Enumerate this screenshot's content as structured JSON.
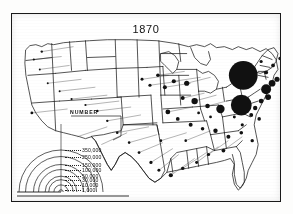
{
  "figure": {
    "year_label": "1870",
    "frame_present": true
  },
  "legend": {
    "title": "NUMBER",
    "entries": [
      {
        "value_label": "350,000",
        "value": 350000
      },
      {
        "value_label": "250,000",
        "value": 250000
      },
      {
        "value_label": "150,000",
        "value": 150000
      },
      {
        "value_label": "100,000",
        "value": 100000
      },
      {
        "value_label": "50,000",
        "value": 50000
      },
      {
        "value_label": "30,000",
        "value": 30000
      },
      {
        "value_label": "10,000",
        "value": 10000
      },
      {
        "value_label": "1,000",
        "value": 1000
      }
    ]
  },
  "colors": {
    "ink": "#1a1a1a",
    "paper": "#ffffff",
    "symbol_fill": "#111111"
  },
  "chart_data": {
    "type": "scatter",
    "title": "1870",
    "xlabel": "",
    "ylabel": "",
    "legend_title": "NUMBER",
    "legend_breaks": [
      350000,
      250000,
      150000,
      100000,
      50000,
      30000,
      10000,
      1000
    ],
    "series": [
      {
        "name": "city-population-symbols",
        "points": [
          {
            "x": 233,
            "y": 62,
            "r": 14.5,
            "value": 350000
          },
          {
            "x": 231,
            "y": 92,
            "r": 10.5,
            "value": 250000
          },
          {
            "x": 256,
            "y": 76,
            "r": 5.0,
            "value": 100000
          },
          {
            "x": 262,
            "y": 70,
            "r": 3.4,
            "value": 60000
          },
          {
            "x": 267,
            "y": 66,
            "r": 2.6,
            "value": 40000
          },
          {
            "x": 258,
            "y": 84,
            "r": 3.0,
            "value": 45000
          },
          {
            "x": 251,
            "y": 88,
            "r": 2.4,
            "value": 32000
          },
          {
            "x": 245,
            "y": 95,
            "r": 2.2,
            "value": 28000
          },
          {
            "x": 241,
            "y": 102,
            "r": 2.0,
            "value": 22000
          },
          {
            "x": 249,
            "y": 106,
            "r": 1.8,
            "value": 18000
          },
          {
            "x": 256,
            "y": 59,
            "r": 2.0,
            "value": 22000
          },
          {
            "x": 263,
            "y": 52,
            "r": 1.9,
            "value": 20000
          },
          {
            "x": 270,
            "y": 45,
            "r": 1.7,
            "value": 15000
          },
          {
            "x": 251,
            "y": 48,
            "r": 1.6,
            "value": 13000
          },
          {
            "x": 244,
            "y": 55,
            "r": 1.5,
            "value": 12000
          },
          {
            "x": 210,
            "y": 96,
            "r": 4.2,
            "value": 80000
          },
          {
            "x": 197,
            "y": 93,
            "r": 2.3,
            "value": 26000
          },
          {
            "x": 184,
            "y": 88,
            "r": 3.2,
            "value": 48000
          },
          {
            "x": 172,
            "y": 85,
            "r": 2.0,
            "value": 21000
          },
          {
            "x": 176,
            "y": 70,
            "r": 2.6,
            "value": 36000
          },
          {
            "x": 163,
            "y": 68,
            "r": 2.1,
            "value": 23000
          },
          {
            "x": 154,
            "y": 74,
            "r": 2.0,
            "value": 20000
          },
          {
            "x": 147,
            "y": 62,
            "r": 1.8,
            "value": 17000
          },
          {
            "x": 139,
            "y": 72,
            "r": 1.6,
            "value": 13000
          },
          {
            "x": 131,
            "y": 66,
            "r": 1.5,
            "value": 11000
          },
          {
            "x": 157,
            "y": 99,
            "r": 2.4,
            "value": 30000
          },
          {
            "x": 167,
            "y": 106,
            "r": 1.9,
            "value": 19000
          },
          {
            "x": 180,
            "y": 112,
            "r": 2.0,
            "value": 20000
          },
          {
            "x": 192,
            "y": 116,
            "r": 1.8,
            "value": 16000
          },
          {
            "x": 205,
            "y": 118,
            "r": 2.2,
            "value": 25000
          },
          {
            "x": 218,
            "y": 124,
            "r": 2.0,
            "value": 21000
          },
          {
            "x": 231,
            "y": 120,
            "r": 1.8,
            "value": 17000
          },
          {
            "x": 242,
            "y": 128,
            "r": 1.7,
            "value": 14000
          },
          {
            "x": 213,
            "y": 138,
            "r": 1.9,
            "value": 18000
          },
          {
            "x": 198,
            "y": 142,
            "r": 1.6,
            "value": 12000
          },
          {
            "x": 186,
            "y": 150,
            "r": 1.5,
            "value": 11000
          },
          {
            "x": 172,
            "y": 156,
            "r": 1.7,
            "value": 14000
          },
          {
            "x": 160,
            "y": 163,
            "r": 2.1,
            "value": 24000
          },
          {
            "x": 148,
            "y": 158,
            "r": 1.5,
            "value": 10000
          },
          {
            "x": 140,
            "y": 150,
            "r": 1.6,
            "value": 12000
          },
          {
            "x": 128,
            "y": 140,
            "r": 1.4,
            "value": 9000
          },
          {
            "x": 118,
            "y": 130,
            "r": 1.3,
            "value": 7000
          },
          {
            "x": 106,
            "y": 120,
            "r": 1.3,
            "value": 6000
          },
          {
            "x": 96,
            "y": 108,
            "r": 1.2,
            "value": 5000
          },
          {
            "x": 86,
            "y": 98,
            "r": 1.2,
            "value": 5000
          },
          {
            "x": 74,
            "y": 92,
            "r": 1.1,
            "value": 4000
          },
          {
            "x": 60,
            "y": 86,
            "r": 1.1,
            "value": 3500
          },
          {
            "x": 48,
            "y": 78,
            "r": 1.0,
            "value": 3000
          },
          {
            "x": 36,
            "y": 70,
            "r": 1.0,
            "value": 2500
          },
          {
            "x": 28,
            "y": 56,
            "r": 1.0,
            "value": 2000
          },
          {
            "x": 22,
            "y": 46,
            "r": 1.1,
            "value": 3000
          },
          {
            "x": 30,
            "y": 38,
            "r": 1.2,
            "value": 5000
          },
          {
            "x": 20,
            "y": 100,
            "r": 1.4,
            "value": 9000
          },
          {
            "x": 232,
            "y": 112,
            "r": 1.6,
            "value": 12000
          },
          {
            "x": 224,
            "y": 104,
            "r": 1.5,
            "value": 11000
          },
          {
            "x": 200,
            "y": 104,
            "r": 1.4,
            "value": 9000
          },
          {
            "x": 188,
            "y": 100,
            "r": 1.4,
            "value": 9000
          },
          {
            "x": 175,
            "y": 128,
            "r": 1.3,
            "value": 8000
          },
          {
            "x": 150,
            "y": 128,
            "r": 1.3,
            "value": 7000
          }
        ]
      }
    ]
  }
}
